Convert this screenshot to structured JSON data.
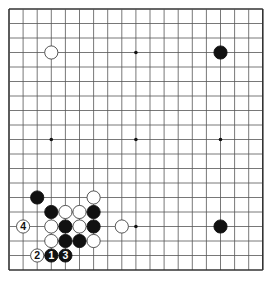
{
  "board": {
    "size": 19,
    "origin": {
      "x": 9,
      "y": 9
    },
    "spacing": {
      "x": 14.1,
      "y": 14.5
    },
    "line_color": "#555555",
    "edge_color": "#333333",
    "star_points": [
      [
        3,
        9
      ],
      [
        9,
        3
      ],
      [
        9,
        9
      ],
      [
        9,
        15
      ],
      [
        15,
        9
      ]
    ]
  },
  "stones": [
    {
      "col": 3,
      "row": 3,
      "color": "white",
      "label": ""
    },
    {
      "col": 15,
      "row": 3,
      "color": "black",
      "label": ""
    },
    {
      "col": 15,
      "row": 15,
      "color": "black",
      "label": ""
    },
    {
      "col": 2,
      "row": 13,
      "color": "black",
      "label": ""
    },
    {
      "col": 6,
      "row": 13,
      "color": "white",
      "label": ""
    },
    {
      "col": 3,
      "row": 14,
      "color": "black",
      "label": ""
    },
    {
      "col": 4,
      "row": 14,
      "color": "white",
      "label": ""
    },
    {
      "col": 5,
      "row": 14,
      "color": "white",
      "label": ""
    },
    {
      "col": 6,
      "row": 14,
      "color": "black",
      "label": ""
    },
    {
      "col": 1,
      "row": 15,
      "color": "white",
      "label": "4"
    },
    {
      "col": 3,
      "row": 15,
      "color": "white",
      "label": ""
    },
    {
      "col": 4,
      "row": 15,
      "color": "black",
      "label": ""
    },
    {
      "col": 5,
      "row": 15,
      "color": "white",
      "label": ""
    },
    {
      "col": 6,
      "row": 15,
      "color": "black",
      "label": ""
    },
    {
      "col": 8,
      "row": 15,
      "color": "white",
      "label": ""
    },
    {
      "col": 3,
      "row": 16,
      "color": "white",
      "label": ""
    },
    {
      "col": 4,
      "row": 16,
      "color": "black",
      "label": ""
    },
    {
      "col": 5,
      "row": 16,
      "color": "black",
      "label": ""
    },
    {
      "col": 6,
      "row": 16,
      "color": "white",
      "label": ""
    },
    {
      "col": 2,
      "row": 17,
      "color": "white",
      "label": "2"
    },
    {
      "col": 3,
      "row": 17,
      "color": "black",
      "label": "1"
    },
    {
      "col": 4,
      "row": 17,
      "color": "black",
      "label": "3"
    }
  ]
}
